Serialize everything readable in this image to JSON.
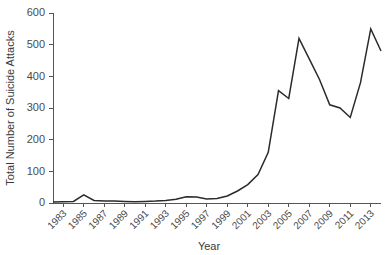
{
  "chart_data": {
    "type": "line",
    "title": "",
    "subtitle": "",
    "xlabel": "Year",
    "ylabel": "Total Number of Suicide Attacks",
    "xlim": [
      1982,
      2014
    ],
    "ylim": [
      0,
      600
    ],
    "grid": false,
    "legend": false,
    "legend_position": "none",
    "line_color": "#2b2b2b",
    "axis_color": "#555555",
    "background_color": "#ffffff",
    "y_ticks": [
      0,
      100,
      200,
      300,
      400,
      500,
      600
    ],
    "y_tick_labels": [
      "0",
      "100",
      "200",
      "300",
      "400",
      "500",
      "600"
    ],
    "x_ticks": [
      1983,
      1985,
      1987,
      1989,
      1991,
      1993,
      1995,
      1997,
      1999,
      2001,
      2003,
      2005,
      2007,
      2009,
      2011,
      2013
    ],
    "x_tick_labels": [
      "1983",
      "1985",
      "1987",
      "1989",
      "1991",
      "1993",
      "1995",
      "1997",
      "1999",
      "2001",
      "2003",
      "2005",
      "2007",
      "2009",
      "2011",
      "2013"
    ],
    "x": [
      1982,
      1983,
      1984,
      1985,
      1986,
      1987,
      1988,
      1989,
      1990,
      1991,
      1992,
      1993,
      1994,
      1995,
      1996,
      1997,
      1998,
      1999,
      2000,
      2001,
      2002,
      2003,
      2004,
      2005,
      2006,
      2007,
      2008,
      2009,
      2010,
      2011,
      2012,
      2013,
      2014
    ],
    "values": [
      3,
      4,
      5,
      26,
      8,
      6,
      6,
      5,
      4,
      5,
      6,
      8,
      12,
      20,
      19,
      13,
      14,
      22,
      38,
      58,
      90,
      160,
      355,
      330,
      520,
      455,
      390,
      310,
      300,
      270,
      380,
      550,
      480
    ],
    "series": [
      {
        "name": "Total Number of Suicide Attacks",
        "values": [
          3,
          4,
          5,
          26,
          8,
          6,
          6,
          5,
          4,
          5,
          6,
          8,
          12,
          20,
          19,
          13,
          14,
          22,
          38,
          58,
          90,
          160,
          355,
          330,
          520,
          455,
          390,
          310,
          300,
          270,
          380,
          550,
          480
        ]
      }
    ],
    "annotations": []
  }
}
